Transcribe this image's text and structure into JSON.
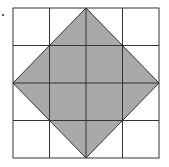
{
  "figure": {
    "type": "grid-with-shaded-square",
    "grid_rows": 4,
    "grid_cols": 4,
    "shape": "rotated square (diamond) with vertices at midpoints of outer grid edges",
    "vertices": [
      {
        "col": 2,
        "row": 0
      },
      {
        "col": 4,
        "row": 2
      },
      {
        "col": 2,
        "row": 4
      },
      {
        "col": 0,
        "row": 2
      }
    ],
    "colors": {
      "shade": "#a9a9a9",
      "grid_line": "#333333",
      "background": "#ffffff"
    },
    "marker": "."
  }
}
